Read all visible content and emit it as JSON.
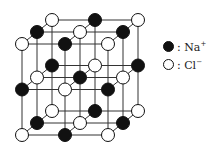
{
  "diagram": {
    "colors": {
      "na": "#111111",
      "cl": "#ffffff",
      "line": "#333333"
    },
    "legend": [
      {
        "kind": "black",
        "label": ": Na",
        "charge": "+"
      },
      {
        "kind": "white",
        "label": ": Cl",
        "charge": "−"
      }
    ],
    "layers": [
      {
        "name": "front",
        "dx": 0,
        "dy": 0,
        "parity": 0
      },
      {
        "name": "middle",
        "dx": 15,
        "dy": -12,
        "parity": 1
      },
      {
        "name": "back",
        "dx": 30,
        "dy": -24,
        "parity": 0
      }
    ],
    "grid": {
      "x0": 22,
      "y0": 44,
      "step_x": 43,
      "step_y": 45.5,
      "n": 3
    }
  }
}
